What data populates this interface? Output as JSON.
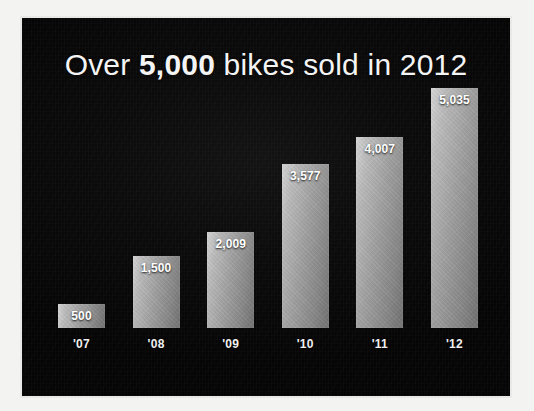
{
  "slide": {
    "title_prefix": "Over ",
    "title_emphasis": "5,000",
    "title_suffix": " bikes sold in 2012",
    "background_color": "#070707",
    "text_color": "#f4f4f4",
    "frame_color": "#e9e9e7"
  },
  "chart_data": {
    "type": "bar",
    "title": "Over 5,000 bikes sold in 2012",
    "xlabel": "",
    "ylabel": "",
    "ylim": [
      0,
      5035
    ],
    "grid": false,
    "legend": "none",
    "value_label_position": "inside-top",
    "bar_color": "#a8a8a8",
    "categories": [
      "'07",
      "'08",
      "'09",
      "'10",
      "'11",
      "'12"
    ],
    "values": [
      500,
      1500,
      2009,
      3577,
      4007,
      5035
    ],
    "value_labels": [
      "500",
      "1,500",
      "2,009",
      "3,577",
      "4,007",
      "5,035"
    ],
    "bars": [
      {
        "category": "'07",
        "value": 500,
        "label": "500",
        "height_pct": 9.9
      },
      {
        "category": "'08",
        "value": 1500,
        "label": "1,500",
        "height_pct": 29.8
      },
      {
        "category": "'09",
        "value": 2009,
        "label": "2,009",
        "height_pct": 39.9
      },
      {
        "category": "'10",
        "value": 3577,
        "label": "3,577",
        "height_pct": 68.3
      },
      {
        "category": "'11",
        "value": 4007,
        "label": "4,007",
        "height_pct": 79.6
      },
      {
        "category": "'12",
        "value": 5035,
        "label": "5,035",
        "height_pct": 100.0
      }
    ]
  }
}
